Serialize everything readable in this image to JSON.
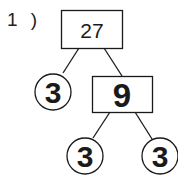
{
  "problem": {
    "number_label": "1 )"
  },
  "tree": {
    "root": {
      "value": "27",
      "shape": "box"
    },
    "left_child": {
      "value": "3",
      "shape": "circle"
    },
    "right_child": {
      "value": "9",
      "shape": "box"
    },
    "right_left_child": {
      "value": "3",
      "shape": "circle"
    },
    "right_right_child": {
      "value": "3",
      "shape": "circle"
    }
  },
  "colors": {
    "stroke": "#1a1a1a",
    "background": "#ffffff"
  }
}
